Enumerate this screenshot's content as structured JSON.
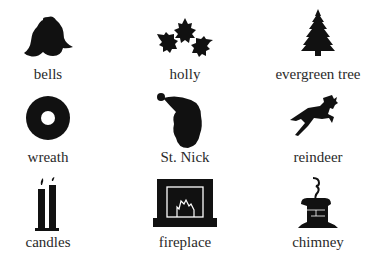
{
  "items": [
    {
      "label": "bells",
      "icon": "bells-icon"
    },
    {
      "label": "holly",
      "icon": "holly-icon"
    },
    {
      "label": "evergreen tree",
      "icon": "evergreen-tree-icon"
    },
    {
      "label": "wreath",
      "icon": "wreath-icon"
    },
    {
      "label": "St. Nick",
      "icon": "st-nick-icon"
    },
    {
      "label": "reindeer",
      "icon": "reindeer-icon"
    },
    {
      "label": "candles",
      "icon": "candles-icon"
    },
    {
      "label": "fireplace",
      "icon": "fireplace-icon"
    },
    {
      "label": "chimney",
      "icon": "chimney-icon"
    }
  ],
  "colors": {
    "ink": "#111111",
    "text": "#2a2a2a",
    "background": "#ffffff"
  }
}
